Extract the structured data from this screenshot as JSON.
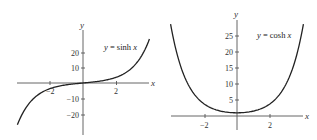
{
  "chart_data": [
    {
      "type": "line",
      "title": "",
      "function": "sinh",
      "legend": "y = sinh x",
      "xlabel": "x",
      "ylabel": "y",
      "x_ticks": [
        -2,
        2
      ],
      "x_tick_labels": [
        "−2",
        "2"
      ],
      "y_ticks": [
        20,
        10,
        -10,
        -20
      ],
      "y_tick_labels": [
        "20",
        "10",
        "−10",
        "−20"
      ],
      "xlim": [
        -4.0,
        4.05
      ],
      "ylim": [
        -30,
        30
      ],
      "grid": false,
      "series": [
        {
          "name": "y = sinh x",
          "x": [
            -4,
            -3,
            -2,
            -1,
            0,
            1,
            2,
            3,
            4
          ],
          "y": [
            -27.29,
            -10.02,
            -3.63,
            -1.18,
            0,
            1.18,
            3.63,
            10.02,
            27.29
          ]
        }
      ]
    },
    {
      "type": "line",
      "title": "",
      "function": "cosh",
      "legend": "y = cosh x",
      "xlabel": "x",
      "ylabel": "y",
      "x_ticks": [
        -2,
        2
      ],
      "x_tick_labels": [
        "−2",
        "2"
      ],
      "y_ticks": [
        25,
        20,
        15,
        10,
        5
      ],
      "y_tick_labels": [
        "25",
        "20",
        "15",
        "10",
        "5"
      ],
      "xlim": [
        -4.05,
        4.05
      ],
      "ylim": [
        0,
        28
      ],
      "grid": false,
      "series": [
        {
          "name": "y = cosh x",
          "x": [
            -4,
            -3,
            -2,
            -1,
            0,
            1,
            2,
            3,
            4
          ],
          "y": [
            27.31,
            10.07,
            3.76,
            1.54,
            1,
            1.54,
            3.76,
            10.07,
            27.31
          ]
        }
      ]
    }
  ],
  "graphs": {
    "sinh": {
      "legend": "y = sinh x",
      "x_axis_label": "x",
      "y_axis_label": "y",
      "x_tick_neg": "−2",
      "x_tick_pos": "2",
      "y_ticks": [
        "20",
        "10",
        "−10",
        "−20"
      ]
    },
    "cosh": {
      "legend": "y = cosh x",
      "x_axis_label": "x",
      "y_axis_label": "y",
      "x_tick_neg": "−2",
      "x_tick_pos": "2",
      "y_ticks": [
        "25",
        "20",
        "15",
        "10",
        "5"
      ]
    }
  }
}
